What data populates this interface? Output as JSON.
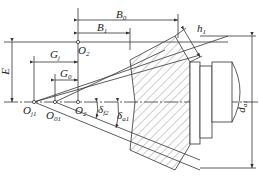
{
  "diagram": {
    "type": "engineering-drawing",
    "colors": {
      "line": "#333333",
      "background": "#ffffff",
      "hatch": "#555555"
    },
    "points": [
      {
        "id": "O_j1",
        "base": "O",
        "sub": "j1"
      },
      {
        "id": "O_01",
        "base": "O",
        "sub": "01"
      },
      {
        "id": "O_2_axis",
        "base": "O",
        "sub": "2"
      },
      {
        "id": "O_2_top",
        "base": "O",
        "sub": "2"
      }
    ],
    "dimensions": [
      {
        "id": "B_0",
        "base": "B",
        "sub": "0"
      },
      {
        "id": "B_1",
        "base": "B",
        "sub": "1"
      },
      {
        "id": "h_1",
        "base": "h",
        "sub": "1"
      },
      {
        "id": "E",
        "base": "E",
        "sub": ""
      },
      {
        "id": "G_j",
        "base": "G",
        "sub": "j"
      },
      {
        "id": "G_0",
        "base": "G",
        "sub": "0"
      },
      {
        "id": "delta_f2",
        "base": "δ",
        "sub": "f2"
      },
      {
        "id": "delta_a1",
        "base": "δ",
        "sub": "a1"
      },
      {
        "id": "d_a1",
        "base": "d",
        "sub": "a1"
      }
    ]
  }
}
